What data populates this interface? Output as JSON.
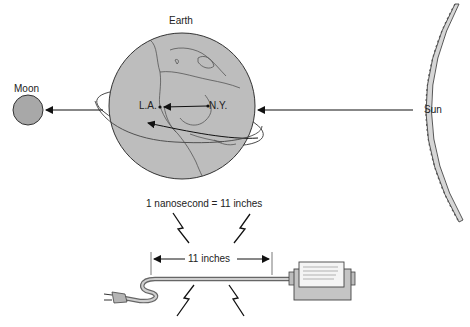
{
  "labels": {
    "earth": "Earth",
    "moon": "Moon",
    "sun": "Sun",
    "la": "L.A.",
    "ny": "N.Y.",
    "equation": "1 nanosecond = 11 inches",
    "length": "11 inches"
  },
  "colors": {
    "earth_fill": "#bdbdbd",
    "moon_fill": "#a8a8a8",
    "sun_fill": "#d6d6d6",
    "line": "#1a1a1a",
    "coast": "#555555"
  }
}
